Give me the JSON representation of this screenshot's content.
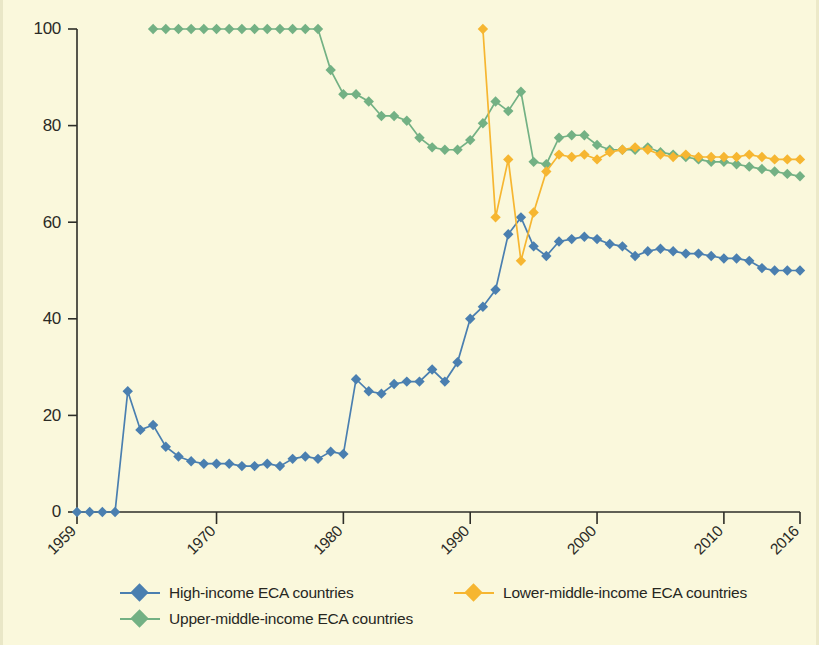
{
  "figure": {
    "background_color": "#faf8dc",
    "axis_color": "#2e2e28"
  },
  "legend": {
    "position": "bottom",
    "items": [
      {
        "label": "High-income ECA countries",
        "color": "#4a7fb0",
        "marker": "diamond-marker"
      },
      {
        "label": "Lower-middle-income ECA countries",
        "color": "#f6b631",
        "marker": "diamond-marker"
      },
      {
        "label": "Upper-middle-income ECA countries",
        "color": "#73b184",
        "marker": "diamond-marker"
      }
    ]
  },
  "chart_data": {
    "type": "line",
    "title": "",
    "subtitle": "",
    "xlabel": "",
    "ylabel": "",
    "xlim": [
      1959,
      2016
    ],
    "ylim": [
      0,
      100
    ],
    "grid": false,
    "legend_position": "bottom",
    "x_ticks": [
      "1959",
      "1970",
      "1980",
      "1990",
      "2000",
      "2010",
      "2016"
    ],
    "x_tick_values": [
      1959,
      1970,
      1980,
      1990,
      2000,
      2010,
      2016
    ],
    "y_ticks": [
      "0",
      "20",
      "40",
      "60",
      "80",
      "100"
    ],
    "y_tick_values": [
      0,
      20,
      40,
      60,
      80,
      100
    ],
    "series": [
      {
        "name": "High-income ECA countries",
        "color": "#4a7fb0",
        "marker": "diamond",
        "x": [
          1959,
          1960,
          1961,
          1962,
          1963,
          1964,
          1965,
          1966,
          1967,
          1968,
          1969,
          1970,
          1971,
          1972,
          1973,
          1974,
          1975,
          1976,
          1977,
          1978,
          1979,
          1980,
          1981,
          1982,
          1983,
          1984,
          1985,
          1986,
          1987,
          1988,
          1989,
          1990,
          1991,
          1992,
          1993,
          1994,
          1995,
          1996,
          1997,
          1998,
          1999,
          2000,
          2001,
          2002,
          2003,
          2004,
          2005,
          2006,
          2007,
          2008,
          2009,
          2010,
          2011,
          2012,
          2013,
          2014,
          2015,
          2016
        ],
        "y": [
          0,
          0,
          0,
          0,
          25,
          17,
          18,
          13.5,
          11.5,
          10.5,
          10,
          10,
          10,
          9.5,
          9.5,
          10,
          9.5,
          11,
          11.5,
          11,
          12.5,
          12,
          27.5,
          25,
          24.5,
          26.5,
          27,
          27,
          29.5,
          27,
          31,
          40,
          42.5,
          46,
          57.5,
          61,
          55,
          53,
          56,
          56.5,
          57,
          56.5,
          55.5,
          55,
          53,
          54,
          54.5,
          54,
          53.5,
          53.5,
          53,
          52.5,
          52.5,
          52,
          50.5,
          50,
          50,
          50
        ]
      },
      {
        "name": "Upper-middle-income ECA countries",
        "color": "#73b184",
        "marker": "diamond",
        "x": [
          1965,
          1966,
          1967,
          1968,
          1969,
          1970,
          1971,
          1972,
          1973,
          1974,
          1975,
          1976,
          1977,
          1978,
          1979,
          1980,
          1981,
          1982,
          1983,
          1984,
          1985,
          1986,
          1987,
          1988,
          1989,
          1990,
          1991,
          1992,
          1993,
          1994,
          1995,
          1996,
          1997,
          1998,
          1999,
          2000,
          2001,
          2002,
          2003,
          2004,
          2005,
          2006,
          2007,
          2008,
          2009,
          2010,
          2011,
          2012,
          2013,
          2014,
          2015,
          2016
        ],
        "y": [
          100,
          100,
          100,
          100,
          100,
          100,
          100,
          100,
          100,
          100,
          100,
          100,
          100,
          100,
          91.5,
          86.5,
          86.5,
          85,
          82,
          82,
          81,
          77.5,
          75.5,
          75,
          75,
          77,
          80.5,
          85,
          83,
          87,
          72.5,
          72,
          77.5,
          78,
          78,
          76,
          75,
          75,
          75,
          75.5,
          74.5,
          74,
          73.5,
          73,
          72.5,
          72.5,
          72,
          71.5,
          71,
          70.5,
          70,
          69.5
        ]
      },
      {
        "name": "Lower-middle-income ECA countries",
        "color": "#f6b631",
        "marker": "diamond",
        "x": [
          1991,
          1992,
          1993,
          1994,
          1995,
          1996,
          1997,
          1998,
          1999,
          2000,
          2001,
          2002,
          2003,
          2004,
          2005,
          2006,
          2007,
          2008,
          2009,
          2010,
          2011,
          2012,
          2013,
          2014,
          2015,
          2016
        ],
        "y": [
          100,
          61,
          73,
          52,
          62,
          70.5,
          74,
          73.5,
          74,
          73,
          74.5,
          75,
          75.5,
          75,
          74,
          73.5,
          74,
          73.5,
          73.5,
          73.5,
          73.5,
          74,
          73.5,
          73,
          73,
          73
        ]
      }
    ]
  }
}
